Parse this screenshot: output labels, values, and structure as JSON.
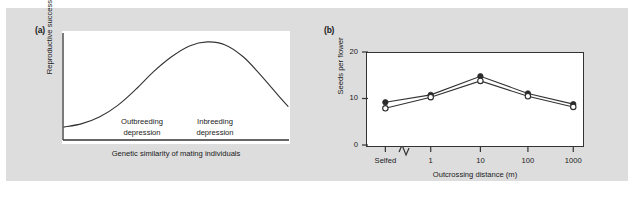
{
  "figure": {
    "background_color": "#dddddd",
    "plot_background_color": "#ffffff",
    "line_color": "#333333"
  },
  "panel_a": {
    "label": "(a)",
    "ylabel": "Reproductive success",
    "xlabel": "Genetic similarity of mating individuals",
    "annotations": [
      {
        "name": "outbreeding",
        "line1": "Outbreeding",
        "line2": "depression"
      },
      {
        "name": "inbreeding",
        "line1": "Inbreeding",
        "line2": "depression"
      }
    ]
  },
  "panel_b": {
    "label": "(b)",
    "ylabel": "Seeds per flower",
    "xlabel": "Outcrossing distance (m)",
    "axis_break_symbol": "zigzag"
  },
  "chart_data": [
    {
      "type": "line",
      "panel": "(a)",
      "title": "",
      "xlabel": "Genetic similarity of mating individuals",
      "ylabel": "Reproductive success",
      "grid": false,
      "legend": "none",
      "axis_ticks": false,
      "description": "Smooth bell-shaped (normal) curve; reproductive success peaks at intermediate genetic similarity, falling off to the left (outbreeding depression) and to the right (inbreeding depression).",
      "x": [
        0,
        0.08,
        0.16,
        0.24,
        0.32,
        0.4,
        0.48,
        0.56,
        0.64,
        0.72,
        0.8,
        0.88,
        0.96,
        1.0
      ],
      "y": [
        0.12,
        0.155,
        0.225,
        0.34,
        0.5,
        0.68,
        0.83,
        0.94,
        0.98,
        0.95,
        0.83,
        0.64,
        0.43,
        0.33
      ],
      "annotations": [
        "Outbreeding depression",
        "Inbreeding depression"
      ]
    },
    {
      "type": "line",
      "panel": "(b)",
      "title": "",
      "xlabel": "Outcrossing distance (m)",
      "ylabel": "Seeds per flower",
      "categories": [
        "Selfed",
        "1",
        "10",
        "100",
        "1000"
      ],
      "ylim": [
        0,
        20
      ],
      "yticks": [
        0,
        10,
        20
      ],
      "ytick_labels": [
        "0",
        "10",
        "20"
      ],
      "grid": false,
      "legend": "none",
      "series": [
        {
          "name": "filled-circles",
          "marker": "filled-circle",
          "values": [
            9.4,
            11.0,
            15.0,
            11.3,
            9.0
          ]
        },
        {
          "name": "open-circles",
          "marker": "open-circle",
          "values": [
            8.1,
            10.5,
            14.0,
            10.7,
            8.4
          ]
        }
      ]
    }
  ]
}
